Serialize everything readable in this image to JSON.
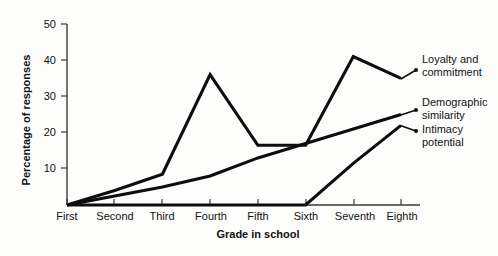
{
  "chart_data": {
    "type": "line",
    "title": "",
    "xlabel": "Grade in school",
    "ylabel": "Percentage of responses",
    "categories": [
      "First",
      "Second",
      "Third",
      "Fourth",
      "Fifth",
      "Sixth",
      "Seventh",
      "Eighth"
    ],
    "ytick_labels": [
      "10",
      "20",
      "30",
      "40",
      "50"
    ],
    "ytick_values": [
      10,
      20,
      30,
      40,
      50
    ],
    "ylim": [
      0,
      50
    ],
    "grid": false,
    "legend_position": "right-inline-labels",
    "series": [
      {
        "name": "Loyalty and commitment",
        "label_line1": "Loyalty and",
        "label_line2": "commitment",
        "values": [
          0,
          4,
          8.5,
          36,
          16.5,
          16.5,
          41,
          35
        ]
      },
      {
        "name": "Demographic similarity",
        "label_line1": "Demographic",
        "label_line2": "similarity",
        "values": [
          0,
          2.5,
          5,
          8,
          13,
          17,
          21,
          25
        ]
      },
      {
        "name": "Intimacy potential",
        "label_line1": "Intimacy",
        "label_line2": "potential",
        "values": [
          0,
          0,
          0,
          0,
          0,
          0,
          11.5,
          22
        ]
      }
    ]
  }
}
